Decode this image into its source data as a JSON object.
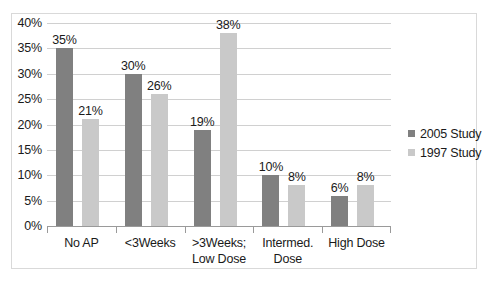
{
  "chart_data": {
    "type": "bar",
    "title": "",
    "xlabel": "",
    "ylabel": "",
    "ylim": [
      0,
      40
    ],
    "ytick_labels": [
      "0%",
      "5%",
      "10%",
      "15%",
      "20%",
      "25%",
      "30%",
      "35%",
      "40%"
    ],
    "ytick_values": [
      0,
      5,
      10,
      15,
      20,
      25,
      30,
      35,
      40
    ],
    "grid": true,
    "legend_position": "right",
    "categories": [
      "No AP",
      "<3Weeks",
      ">3Weeks; Low Dose",
      "Intermed. Dose",
      "High Dose"
    ],
    "category_lines": [
      [
        "No AP"
      ],
      [
        "<3Weeks"
      ],
      [
        ">3Weeks;",
        "Low Dose"
      ],
      [
        "Intermed.",
        "Dose"
      ],
      [
        "High Dose"
      ]
    ],
    "series": [
      {
        "name": "2005 Study",
        "color": "#808080",
        "values": [
          35,
          30,
          19,
          10,
          6
        ],
        "labels": [
          "35%",
          "30%",
          "19%",
          "10%",
          "6%"
        ]
      },
      {
        "name": "1997 Study",
        "color": "#c9c9c9",
        "values": [
          21,
          26,
          38,
          8,
          8
        ],
        "labels": [
          "21%",
          "26%",
          "38%",
          "8%",
          "8%"
        ]
      }
    ]
  },
  "legend": {
    "items": [
      {
        "label": "2005 Study",
        "color": "#808080"
      },
      {
        "label": "1997 Study",
        "color": "#c9c9c9"
      }
    ]
  }
}
